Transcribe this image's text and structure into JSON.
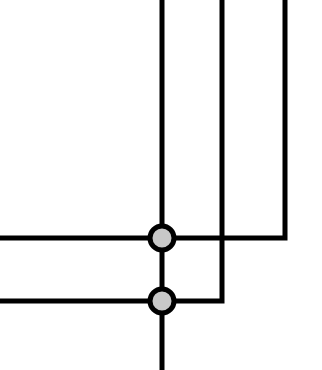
{
  "diagram": {
    "type": "wire-junction-schematic",
    "background": "#ffffff",
    "wire_color": "#000000",
    "wire_width": 5,
    "node_fill": "#c8c8c8",
    "node_stroke": "#000000",
    "node_stroke_width": 5,
    "node_radius": 12,
    "wires": [
      {
        "id": "main-vertical",
        "points": "162,0 162,370"
      },
      {
        "id": "middle-wire",
        "points": "222,0 222,301 162,301"
      },
      {
        "id": "right-wire",
        "points": "285,0 285,238 162,238"
      },
      {
        "id": "left-upper-wire",
        "points": "0,238 162,238"
      },
      {
        "id": "left-lower-wire",
        "points": "0,301 162,301"
      }
    ],
    "nodes": [
      {
        "id": "junction-upper",
        "cx": 162,
        "cy": 238
      },
      {
        "id": "junction-lower",
        "cx": 162,
        "cy": 301
      }
    ]
  }
}
